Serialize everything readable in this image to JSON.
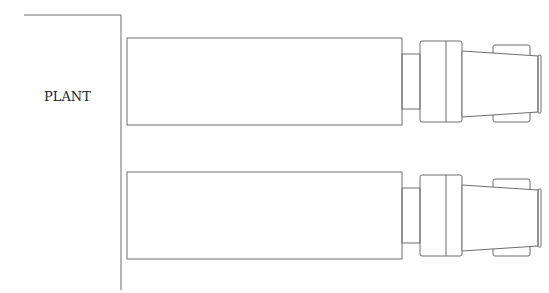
{
  "diagram": {
    "plant_label": "PLANT",
    "units": [
      {
        "name": "unit-upper"
      },
      {
        "name": "unit-lower"
      }
    ],
    "line_color": "#6e6e6e"
  }
}
